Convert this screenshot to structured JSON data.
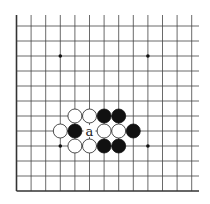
{
  "diagram": {
    "type": "go-board-fragment",
    "visible_edges": [
      "left",
      "bottom"
    ],
    "columns": 13,
    "rows": 12,
    "star_points": [
      {
        "col": 3,
        "row": 3
      },
      {
        "col": 9,
        "row": 3
      },
      {
        "col": 3,
        "row": 9
      },
      {
        "col": 9,
        "row": 9
      }
    ],
    "stones": [
      {
        "color": "white",
        "col": 4,
        "row": 5
      },
      {
        "color": "white",
        "col": 5,
        "row": 5
      },
      {
        "color": "black",
        "col": 6,
        "row": 5
      },
      {
        "color": "black",
        "col": 7,
        "row": 5
      },
      {
        "color": "white",
        "col": 3,
        "row": 4
      },
      {
        "color": "black",
        "col": 4,
        "row": 4
      },
      {
        "color": "white",
        "col": 6,
        "row": 4
      },
      {
        "color": "white",
        "col": 7,
        "row": 4
      },
      {
        "color": "black",
        "col": 8,
        "row": 4
      },
      {
        "color": "white",
        "col": 4,
        "row": 3
      },
      {
        "color": "white",
        "col": 5,
        "row": 3
      },
      {
        "color": "black",
        "col": 6,
        "row": 3
      },
      {
        "color": "black",
        "col": 7,
        "row": 3
      }
    ],
    "labels": [
      {
        "text": "a",
        "col": 5,
        "row": 4
      }
    ],
    "colors": {
      "black_stone": "#111111",
      "white_stone": "#ffffff",
      "line": "#444444"
    }
  }
}
